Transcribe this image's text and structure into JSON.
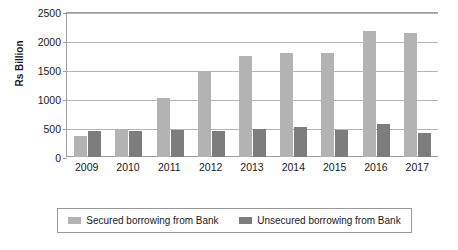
{
  "chart_data": {
    "type": "bar",
    "title": "",
    "subtitle": "",
    "xlabel": "",
    "ylabel": "Rs Billion",
    "ylim": [
      0,
      2500
    ],
    "yticks": [
      0,
      500,
      1000,
      1500,
      2000,
      2500
    ],
    "ytick_labels": [
      "0",
      "500",
      "1000",
      "1500",
      "2000",
      "2500"
    ],
    "grid": true,
    "legend_position": "bottom",
    "categories": [
      "2009",
      "2010",
      "2011",
      "2012",
      "2013",
      "2014",
      "2015",
      "2016",
      "2017"
    ],
    "series": [
      {
        "name": "Secured borrowing from Bank",
        "color": "#b3b3b3",
        "values": [
          370,
          460,
          1010,
          1490,
          1750,
          1800,
          1800,
          2170,
          2140
        ]
      },
      {
        "name": "Unsecured borrowing from Bank",
        "color": "#7d7d7d",
        "values": [
          440,
          450,
          470,
          450,
          480,
          510,
          460,
          570,
          415
        ]
      }
    ]
  },
  "colors": {
    "secured": "#b3b3b3",
    "unsecured": "#7d7d7d",
    "gridline": "#b5b5b5",
    "axis": "#9c9c9c",
    "text": "#1a1a1a",
    "background": "#ffffff"
  }
}
